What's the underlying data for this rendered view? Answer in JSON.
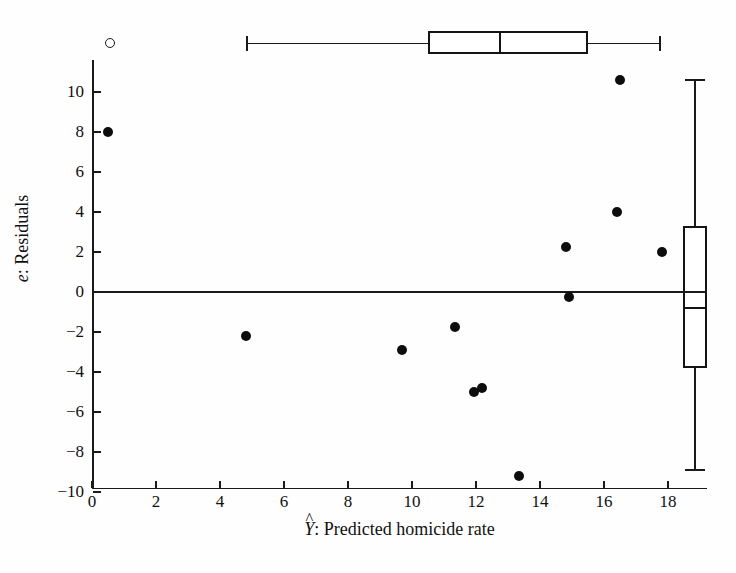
{
  "chart_data": {
    "type": "scatter",
    "title": "",
    "xlabel": "Ŷ:   Predicted homicide rate",
    "xlabel_symbol": "Y",
    "xlabel_text": ":   Predicted homicide rate",
    "ylabel": "e:  Residuals",
    "ylabel_symbol": "e",
    "ylabel_text": ":  Residuals",
    "xlim": [
      0,
      19.2
    ],
    "ylim": [
      -10,
      13.4
    ],
    "xticks": [
      0,
      2,
      4,
      6,
      8,
      10,
      12,
      14,
      16,
      18
    ],
    "yticks": [
      -10,
      -8,
      -6,
      -4,
      -2,
      0,
      2,
      4,
      6,
      8,
      10
    ],
    "xtick_labels": [
      "0",
      "2",
      "4",
      "6",
      "8",
      "10",
      "12",
      "14",
      "16",
      "18"
    ],
    "ytick_labels": [
      "-10",
      "-8",
      "-6",
      "-4",
      "-2",
      "0",
      "2",
      "4",
      "6",
      "8",
      "10"
    ],
    "grid": false,
    "legend": null,
    "reference_line": {
      "axis": "horizontal",
      "value": 0
    },
    "points": [
      {
        "x": 0.5,
        "y": 8.0,
        "marker": "filled"
      },
      {
        "x": 4.8,
        "y": -2.2,
        "marker": "filled"
      },
      {
        "x": 9.7,
        "y": -2.9,
        "marker": "filled"
      },
      {
        "x": 11.35,
        "y": -1.75,
        "marker": "filled"
      },
      {
        "x": 11.95,
        "y": -5.0,
        "marker": "filled"
      },
      {
        "x": 12.2,
        "y": -4.8,
        "marker": "filled"
      },
      {
        "x": 13.35,
        "y": -9.2,
        "marker": "filled"
      },
      {
        "x": 14.8,
        "y": 2.25,
        "marker": "filled"
      },
      {
        "x": 14.9,
        "y": -0.25,
        "marker": "filled"
      },
      {
        "x": 16.4,
        "y": 4.0,
        "marker": "filled"
      },
      {
        "x": 16.5,
        "y": 10.6,
        "marker": "filled"
      },
      {
        "x": 17.8,
        "y": 2.0,
        "marker": "filled"
      }
    ],
    "outlier_marker": {
      "x": 0.55,
      "y": 12.45,
      "marker": "open"
    },
    "boxplot_x": {
      "orientation": "horizontal",
      "whisker_low": 4.85,
      "q1": 10.5,
      "median": 12.75,
      "q3": 15.5,
      "whisker_high": 17.75
    },
    "boxplot_y": {
      "orientation": "vertical",
      "whisker_low": -8.9,
      "q1": -3.8,
      "median": -0.8,
      "q3": 3.3,
      "whisker_high": 10.6
    },
    "colors": {
      "marker": "#0d0d0d",
      "axis": "#1a1a1a",
      "background": "#fefefe",
      "box_fill": "#ffffff"
    }
  }
}
